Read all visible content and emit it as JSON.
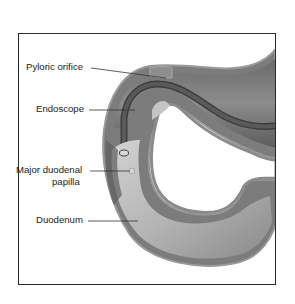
{
  "figure": {
    "type": "anatomical-illustration",
    "labels": [
      {
        "id": "pyloric-orifice",
        "text": "Pyloric orifice"
      },
      {
        "id": "endoscope",
        "text": "Endoscope"
      },
      {
        "id": "major-duodenal-papilla",
        "line1": "Major duodenal",
        "line2": "papilla"
      },
      {
        "id": "duodenum",
        "text": "Duodenum"
      }
    ],
    "colors": {
      "frame": "#2a2a2a",
      "outer_wall": "#7a7a7a",
      "wall_edge": "#9a9a9a",
      "lumen_dark": "#555555",
      "lumen_mid": "#8a8a8a",
      "lumen_light": "#c8c8c8",
      "endoscope": "#3a3a3a",
      "leader_line": "#333333"
    }
  }
}
